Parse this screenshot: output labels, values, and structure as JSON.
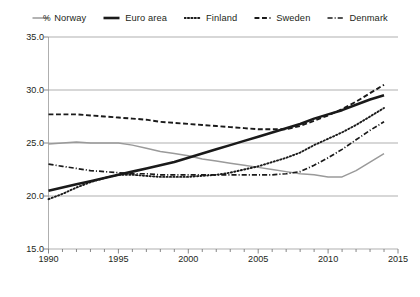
{
  "chart_data": {
    "type": "line",
    "title": "",
    "xlabel": "",
    "ylabel": "%",
    "unit_label": "%",
    "xlim": [
      1990,
      2015
    ],
    "ylim": [
      15.0,
      35.0
    ],
    "grid": true,
    "grid_axis": "y",
    "legend_position": "top",
    "x": [
      1990,
      1991,
      1992,
      1993,
      1994,
      1995,
      1996,
      1997,
      1998,
      1999,
      2000,
      2001,
      2002,
      2003,
      2004,
      2005,
      2006,
      2007,
      2008,
      2009,
      2010,
      2011,
      2012,
      2013,
      2014
    ],
    "ytick_labels": [
      "35.0",
      "30.0",
      "25.0",
      "20.0",
      "15.0"
    ],
    "ytick_values": [
      35.0,
      30.0,
      25.0,
      20.0,
      15.0
    ],
    "xtick_labels": [
      "1990",
      "1995",
      "2000",
      "2005",
      "2010",
      "2015"
    ],
    "xtick_values": [
      1990,
      1995,
      2000,
      2005,
      2010,
      2015
    ],
    "series": [
      {
        "name": "Norway",
        "style": "solid",
        "color": "#9a9a9a",
        "width": 1.5,
        "values": [
          24.9,
          25.0,
          25.1,
          25.0,
          25.0,
          25.0,
          24.8,
          24.5,
          24.2,
          24.0,
          23.8,
          23.5,
          23.3,
          23.1,
          22.9,
          22.7,
          22.5,
          22.3,
          22.1,
          22.0,
          21.8,
          21.8,
          22.4,
          23.2,
          24.0
        ]
      },
      {
        "name": "Euro area",
        "style": "solid",
        "color": "#1a1a1a",
        "width": 2.6,
        "values": [
          20.5,
          20.8,
          21.1,
          21.4,
          21.7,
          22.0,
          22.3,
          22.6,
          22.9,
          23.2,
          23.6,
          24.0,
          24.4,
          24.8,
          25.2,
          25.6,
          26.0,
          26.4,
          26.8,
          27.3,
          27.7,
          28.1,
          28.6,
          29.1,
          29.5
        ]
      },
      {
        "name": "Finland",
        "style": "dotted",
        "color": "#1a1a1a",
        "width": 1.9,
        "values": [
          19.7,
          20.2,
          20.8,
          21.3,
          21.7,
          22.0,
          22.0,
          21.9,
          21.8,
          21.8,
          21.8,
          21.9,
          22.0,
          22.2,
          22.5,
          22.8,
          23.2,
          23.6,
          24.1,
          24.8,
          25.4,
          26.0,
          26.7,
          27.5,
          28.3
        ]
      },
      {
        "name": "Sweden",
        "style": "dashed",
        "color": "#1a1a1a",
        "width": 1.9,
        "values": [
          27.7,
          27.7,
          27.7,
          27.6,
          27.5,
          27.4,
          27.3,
          27.2,
          27.0,
          26.9,
          26.8,
          26.7,
          26.6,
          26.5,
          26.4,
          26.3,
          26.3,
          26.3,
          26.6,
          27.1,
          27.6,
          28.2,
          28.9,
          29.7,
          30.5
        ]
      },
      {
        "name": "Denmark",
        "style": "dashdot",
        "color": "#1a1a1a",
        "width": 1.7,
        "values": [
          23.0,
          22.8,
          22.6,
          22.4,
          22.3,
          22.2,
          22.1,
          22.1,
          22.0,
          22.0,
          22.0,
          22.0,
          22.0,
          22.0,
          22.0,
          22.0,
          22.0,
          22.1,
          22.3,
          22.9,
          23.6,
          24.4,
          25.3,
          26.2,
          27.0
        ]
      }
    ]
  }
}
